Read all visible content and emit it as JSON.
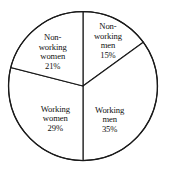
{
  "chart_data": {
    "type": "pie",
    "title": "",
    "subtitle": "",
    "xlabel": "",
    "ylabel": "",
    "legend_position": "none",
    "grid": false,
    "units": "percent",
    "total": 100,
    "categories": [
      "Non-working men",
      "Working men",
      "Working women",
      "Non-working women"
    ],
    "values": [
      15,
      35,
      29,
      21
    ],
    "slices": [
      {
        "name": "non-working-men",
        "label_lines": [
          "Non-",
          "working",
          "men"
        ],
        "value": 15,
        "value_label": "15%",
        "start_angle_deg": 0,
        "end_angle_deg": 54,
        "label_x_pct": 63.5,
        "label_y_pct": 24.0
      },
      {
        "name": "working-men",
        "label_lines": [
          "Working",
          "men"
        ],
        "value": 35,
        "value_label": "35%",
        "start_angle_deg": 54,
        "end_angle_deg": 180,
        "label_x_pct": 64.5,
        "label_y_pct": 70.0
      },
      {
        "name": "working-women",
        "label_lines": [
          "Working",
          "women"
        ],
        "value": 29,
        "value_label": "29%",
        "start_angle_deg": 180,
        "end_angle_deg": 284.4,
        "label_x_pct": 32.5,
        "label_y_pct": 69.5
      },
      {
        "name": "non-working-women",
        "label_lines": [
          "Non-",
          "working",
          "women"
        ],
        "value": 21,
        "value_label": "21%",
        "start_angle_deg": 284.4,
        "end_angle_deg": 360,
        "label_x_pct": 31.0,
        "label_y_pct": 30.5
      }
    ],
    "geometry": {
      "center_x": 83,
      "center_y": 86,
      "radius": 74.5
    },
    "colors": {
      "background": "#ffffff",
      "slice_fill": "#ffffff",
      "stroke": "#1a1a1a",
      "text": "#111111"
    }
  },
  "labels": {
    "slice_0": {
      "l0": "Non-",
      "l1": "working",
      "l2": "men",
      "value": "15%"
    },
    "slice_1": {
      "l0": "Working",
      "l1": "men",
      "value": "35%"
    },
    "slice_2": {
      "l0": "Working",
      "l1": "women",
      "value": "29%"
    },
    "slice_3": {
      "l0": "Non-",
      "l1": "working",
      "l2": "women",
      "value": "21%"
    }
  }
}
